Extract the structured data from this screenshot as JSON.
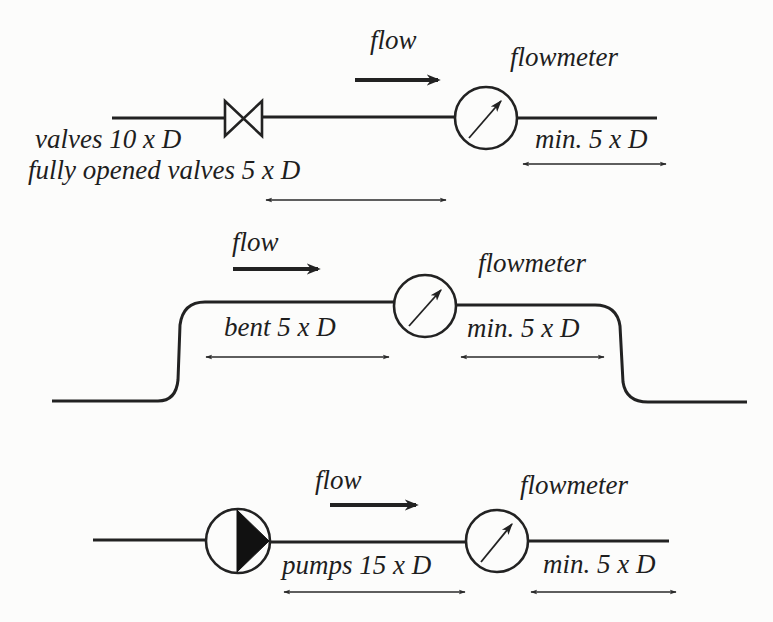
{
  "diagram": {
    "colors": {
      "ink": "#222222",
      "background": "#fcfcfb"
    },
    "panels": [
      {
        "id": "valves",
        "flow_label": "flow",
        "meter_label": "flowmeter",
        "upstream_labels": [
          "valves 10 x D",
          "fully opened valves 5 x D"
        ],
        "downstream_label": "min. 5 x D",
        "upstream_component": "valve-icon"
      },
      {
        "id": "bend",
        "flow_label": "flow",
        "meter_label": "flowmeter",
        "upstream_labels": [
          "bent 5 x D"
        ],
        "downstream_label": "min. 5 x D",
        "upstream_component": "pipe-bend"
      },
      {
        "id": "pumps",
        "flow_label": "flow",
        "meter_label": "flowmeter",
        "upstream_labels": [
          "pumps 15 x D"
        ],
        "downstream_label": "min. 5 x D",
        "upstream_component": "pump-icon"
      }
    ]
  }
}
